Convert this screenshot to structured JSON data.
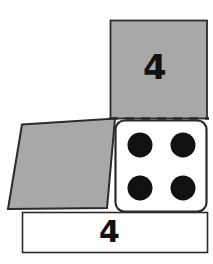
{
  "figure": {
    "background_color": "#ffffff",
    "stroke_color": "#222222",
    "gray_fill": "#a8a8a8",
    "white_fill": "#ffffff",
    "pip_color": "#111111"
  },
  "faces": {
    "top_panel": {
      "name": "top-face",
      "fill": "#a8a8a8",
      "label": "4",
      "geometry": {
        "x": 110,
        "y": 20,
        "width": 97,
        "height": 98
      }
    },
    "left_panel": {
      "name": "left-face-skewed",
      "fill": "#a8a8a8",
      "label": "",
      "geometry": {
        "points": "22,124 115,118 107,208 8,209"
      }
    },
    "dice_panel": {
      "name": "dice-face",
      "fill": "#ffffff",
      "label": "",
      "geometry": {
        "x": 115,
        "y": 120,
        "width": 92,
        "height": 92,
        "corner_radius": 9
      }
    },
    "bottom_panel": {
      "name": "bottom-face",
      "fill": "#ffffff",
      "label": "4",
      "geometry": {
        "x": 22,
        "y": 212,
        "width": 185,
        "height": 40
      }
    }
  },
  "fold_line": {
    "name": "dashed-fold-line",
    "x1": 110,
    "x2": 208,
    "y": 118,
    "dash": "9 7",
    "color": "#222222"
  },
  "pips": {
    "count": 4,
    "radius": 12,
    "color": "#111111",
    "positions": [
      {
        "cx": 140,
        "cy": 145
      },
      {
        "cx": 183,
        "cy": 145
      },
      {
        "cx": 140,
        "cy": 188
      },
      {
        "cx": 183,
        "cy": 188
      }
    ]
  },
  "labels": {
    "top_face_value": "4",
    "bottom_face_value": "4"
  }
}
